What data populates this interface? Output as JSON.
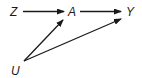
{
  "diagram": {
    "type": "causal-dag",
    "nodes": [
      {
        "id": "Z",
        "label": "Z"
      },
      {
        "id": "A",
        "label": "A"
      },
      {
        "id": "Y",
        "label": "Y"
      },
      {
        "id": "U",
        "label": "U"
      }
    ],
    "edges": [
      {
        "from": "Z",
        "to": "A"
      },
      {
        "from": "A",
        "to": "Y"
      },
      {
        "from": "U",
        "to": "A"
      },
      {
        "from": "U",
        "to": "Y"
      }
    ],
    "colors": {
      "stroke": "#1a1a1a",
      "background": "#ffffff"
    }
  }
}
